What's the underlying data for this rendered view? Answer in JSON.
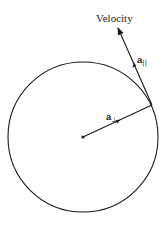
{
  "diagram": {
    "labels": {
      "velocity": "Velocity",
      "a_parallel": {
        "base": "a",
        "subscript": "||"
      },
      "a_perpendicular": {
        "base": "a",
        "subscript": "⊥"
      }
    },
    "circle": {
      "center": [
        83,
        137
      ],
      "radius": 75
    },
    "radius_vector": {
      "from": [
        83,
        137
      ],
      "to": [
        152,
        105
      ],
      "label": "a⊥"
    },
    "tangent_vector": {
      "from": [
        152,
        105
      ],
      "to": [
        118,
        28
      ],
      "label": "Velocity"
    },
    "colors": {
      "stroke": "#1a1a1a",
      "background": "#ffffff"
    }
  }
}
